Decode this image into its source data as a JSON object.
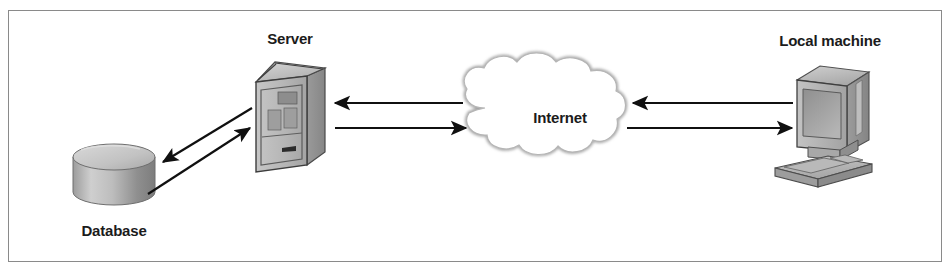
{
  "figure": {
    "border_color": "#8a8a8a",
    "background": "#ffffff",
    "ink_color": "#1b1b1b"
  },
  "nodes": [
    {
      "id": "database",
      "label": "Database",
      "icon": "database-cylinder-icon",
      "shape": "cylinder"
    },
    {
      "id": "server",
      "label": "Server",
      "icon": "server-tower-icon",
      "shape": "isometric-tower"
    },
    {
      "id": "internet",
      "label": "Internet",
      "icon": "cloud-icon",
      "shape": "cloud"
    },
    {
      "id": "local_machine",
      "label": "Local machine",
      "icon": "desktop-computer-icon",
      "shape": "crt-monitor-keyboard"
    }
  ],
  "connections": [
    {
      "id": "server-to-database",
      "from": "server",
      "to": "database",
      "direction": "left",
      "style": "diagonal-arrow"
    },
    {
      "id": "database-to-server",
      "from": "database",
      "to": "server",
      "direction": "right",
      "style": "diagonal-arrow"
    },
    {
      "id": "internet-to-server",
      "from": "internet",
      "to": "server",
      "direction": "left",
      "style": "horizontal-arrow"
    },
    {
      "id": "server-to-internet",
      "from": "server",
      "to": "internet",
      "direction": "right",
      "style": "horizontal-arrow"
    },
    {
      "id": "local-machine-to-internet",
      "from": "local_machine",
      "to": "internet",
      "direction": "left",
      "style": "horizontal-arrow"
    },
    {
      "id": "internet-to-local-machine",
      "from": "internet",
      "to": "local_machine",
      "direction": "right",
      "style": "horizontal-arrow"
    }
  ]
}
